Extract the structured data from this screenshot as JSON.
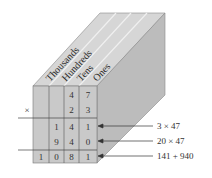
{
  "diagram": {
    "columns": [
      "Thousands",
      "Hundreds",
      "Tens",
      "Ones"
    ],
    "operator": "×",
    "rows": [
      [
        "",
        "",
        "4",
        "7"
      ],
      [
        "",
        "",
        "2",
        "3"
      ],
      [
        "",
        "1",
        "4",
        "1"
      ],
      [
        "",
        "9",
        "4",
        "0"
      ],
      [
        "1",
        "0",
        "8",
        "1"
      ]
    ],
    "annotations": [
      "3 × 47",
      "20 × 47",
      "141 + 940"
    ],
    "colors": {
      "front_face": "#c8c8c8",
      "top_face": "#d4d4d4",
      "side_face": "#bdbdbd",
      "lines": "#555555",
      "text": "#333333"
    }
  }
}
